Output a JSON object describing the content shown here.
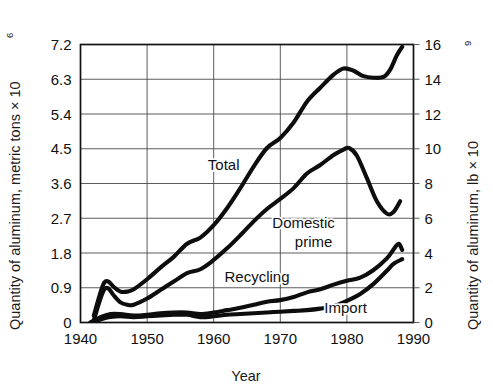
{
  "chart_data": {
    "type": "line",
    "title": "",
    "xlabel": "Year",
    "ylabel": "Quantity of aluminum, metric tons × 10",
    "ylabel_exponent": "6",
    "ylabel_right": "Quantity of aluminum, lb × 10",
    "ylabel_right_exponent": "9",
    "xlim": [
      1940,
      1990
    ],
    "ylim": [
      0,
      7.2
    ],
    "ylim_right": [
      0,
      16
    ],
    "grid": true,
    "legend_position": "inline-annotations",
    "xticks": [
      "1940",
      "1950",
      "1960",
      "1970",
      "1980",
      "1990"
    ],
    "xtick_values": [
      1940,
      1950,
      1960,
      1970,
      1980,
      1990
    ],
    "yticks": [
      "0",
      "0.9",
      "1.8",
      "2.7",
      "3.6",
      "4.5",
      "5.4",
      "6.3",
      "7.2"
    ],
    "ytick_values": [
      0,
      0.9,
      1.8,
      2.7,
      3.6,
      4.5,
      5.4,
      6.3,
      7.2
    ],
    "yticks_right": [
      "0",
      "2",
      "4",
      "6",
      "8",
      "10",
      "12",
      "14",
      "16"
    ],
    "ytick_values_right": [
      0,
      2,
      4,
      6,
      8,
      10,
      12,
      14,
      16
    ],
    "annotations": [
      {
        "text": "Total",
        "x": 1961.5,
        "y": 3.95
      },
      {
        "text": "Domestic",
        "x": 1973.5,
        "y": 2.44
      },
      {
        "text": "prime",
        "x": 1975.0,
        "y": 1.96
      },
      {
        "text": "Recycling",
        "x": 1966.5,
        "y": 1.06
      },
      {
        "text": "Import",
        "x": 1979.8,
        "y": 0.25
      }
    ],
    "series": [
      {
        "name": "Total",
        "points": [
          [
            1942.0,
            0.18
          ],
          [
            1943.0,
            0.78
          ],
          [
            1943.6,
            1.04
          ],
          [
            1944.2,
            1.06
          ],
          [
            1945.0,
            0.92
          ],
          [
            1946.0,
            0.8
          ],
          [
            1947.0,
            0.8
          ],
          [
            1948.0,
            0.86
          ],
          [
            1950.0,
            1.12
          ],
          [
            1952.0,
            1.42
          ],
          [
            1954.0,
            1.7
          ],
          [
            1956.0,
            2.04
          ],
          [
            1958.0,
            2.2
          ],
          [
            1960.0,
            2.52
          ],
          [
            1962.0,
            2.96
          ],
          [
            1964.0,
            3.48
          ],
          [
            1966.0,
            4.04
          ],
          [
            1968.0,
            4.52
          ],
          [
            1970.0,
            4.78
          ],
          [
            1972.0,
            5.18
          ],
          [
            1974.0,
            5.72
          ],
          [
            1976.0,
            6.08
          ],
          [
            1978.0,
            6.42
          ],
          [
            1979.5,
            6.58
          ],
          [
            1981.0,
            6.52
          ],
          [
            1982.5,
            6.38
          ],
          [
            1984.0,
            6.34
          ],
          [
            1985.5,
            6.36
          ],
          [
            1986.5,
            6.55
          ],
          [
            1987.5,
            6.92
          ],
          [
            1988.3,
            7.14
          ]
        ]
      },
      {
        "name": "Domestic prime",
        "points": [
          [
            1942.0,
            0.06
          ],
          [
            1943.0,
            0.62
          ],
          [
            1943.6,
            0.86
          ],
          [
            1944.2,
            0.88
          ],
          [
            1945.0,
            0.7
          ],
          [
            1946.0,
            0.52
          ],
          [
            1947.0,
            0.46
          ],
          [
            1948.0,
            0.46
          ],
          [
            1950.0,
            0.62
          ],
          [
            1952.0,
            0.84
          ],
          [
            1954.0,
            1.06
          ],
          [
            1956.0,
            1.28
          ],
          [
            1958.0,
            1.38
          ],
          [
            1960.0,
            1.62
          ],
          [
            1962.0,
            1.92
          ],
          [
            1964.0,
            2.26
          ],
          [
            1966.0,
            2.62
          ],
          [
            1968.0,
            2.94
          ],
          [
            1970.0,
            3.2
          ],
          [
            1972.0,
            3.48
          ],
          [
            1974.0,
            3.86
          ],
          [
            1976.0,
            4.08
          ],
          [
            1978.0,
            4.34
          ],
          [
            1979.5,
            4.48
          ],
          [
            1980.3,
            4.52
          ],
          [
            1981.5,
            4.32
          ],
          [
            1983.0,
            3.74
          ],
          [
            1984.5,
            3.14
          ],
          [
            1986.0,
            2.82
          ],
          [
            1987.0,
            2.86
          ],
          [
            1988.0,
            3.14
          ]
        ]
      },
      {
        "name": "Recycling",
        "points": [
          [
            1941.5,
            0.0
          ],
          [
            1943.0,
            0.14
          ],
          [
            1944.5,
            0.22
          ],
          [
            1946.0,
            0.22
          ],
          [
            1948.0,
            0.18
          ],
          [
            1950.0,
            0.2
          ],
          [
            1952.0,
            0.24
          ],
          [
            1954.0,
            0.26
          ],
          [
            1956.0,
            0.26
          ],
          [
            1958.0,
            0.22
          ],
          [
            1960.0,
            0.26
          ],
          [
            1962.0,
            0.32
          ],
          [
            1964.0,
            0.38
          ],
          [
            1966.0,
            0.46
          ],
          [
            1968.0,
            0.54
          ],
          [
            1970.0,
            0.58
          ],
          [
            1972.0,
            0.66
          ],
          [
            1974.0,
            0.78
          ],
          [
            1976.0,
            0.86
          ],
          [
            1978.0,
            0.98
          ],
          [
            1980.0,
            1.08
          ],
          [
            1982.0,
            1.16
          ],
          [
            1984.0,
            1.36
          ],
          [
            1986.0,
            1.66
          ],
          [
            1987.2,
            1.94
          ],
          [
            1987.8,
            2.04
          ],
          [
            1988.3,
            1.88
          ]
        ]
      },
      {
        "name": "Import",
        "points": [
          [
            1941.5,
            0.0
          ],
          [
            1943.0,
            0.08
          ],
          [
            1944.5,
            0.14
          ],
          [
            1946.0,
            0.16
          ],
          [
            1948.0,
            0.14
          ],
          [
            1950.0,
            0.16
          ],
          [
            1952.0,
            0.18
          ],
          [
            1954.0,
            0.2
          ],
          [
            1956.0,
            0.2
          ],
          [
            1958.0,
            0.14
          ],
          [
            1960.0,
            0.16
          ],
          [
            1962.0,
            0.2
          ],
          [
            1964.0,
            0.22
          ],
          [
            1966.0,
            0.24
          ],
          [
            1968.0,
            0.26
          ],
          [
            1970.0,
            0.28
          ],
          [
            1972.0,
            0.3
          ],
          [
            1974.0,
            0.32
          ],
          [
            1976.0,
            0.36
          ],
          [
            1978.0,
            0.42
          ],
          [
            1980.0,
            0.56
          ],
          [
            1982.0,
            0.74
          ],
          [
            1984.0,
            1.0
          ],
          [
            1986.0,
            1.34
          ],
          [
            1987.0,
            1.52
          ],
          [
            1988.3,
            1.64
          ]
        ]
      }
    ]
  }
}
